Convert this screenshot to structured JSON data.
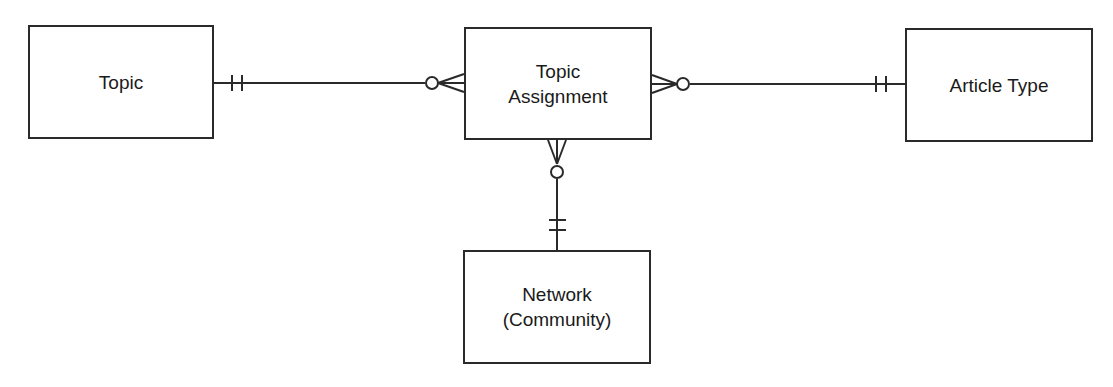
{
  "diagram": {
    "type": "entity-relationship (crow's foot)",
    "entities": [
      {
        "id": "topic",
        "label_lines": [
          "Topic"
        ]
      },
      {
        "id": "topic_assignment",
        "label_lines": [
          "Topic",
          "Assignment"
        ]
      },
      {
        "id": "article_type",
        "label_lines": [
          "Article Type"
        ]
      },
      {
        "id": "network",
        "label_lines": [
          "Network",
          "(Community)"
        ]
      }
    ],
    "relationships": [
      {
        "from": "Topic",
        "from_cardinality": "exactly one",
        "to": "Topic Assignment",
        "to_cardinality": "zero or many"
      },
      {
        "from": "Article Type",
        "from_cardinality": "exactly one",
        "to": "Topic Assignment",
        "to_cardinality": "zero or many"
      },
      {
        "from": "Network (Community)",
        "from_cardinality": "exactly one",
        "to": "Topic Assignment",
        "to_cardinality": "zero or many"
      }
    ]
  }
}
